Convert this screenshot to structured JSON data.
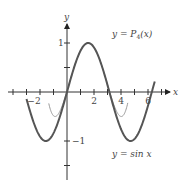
{
  "chart_data": {
    "type": "line",
    "title": "",
    "xlabel": "x",
    "ylabel": "y",
    "xlim": [
      -3.5,
      8.5
    ],
    "ylim": [
      -1.9,
      1.9
    ],
    "grid": false,
    "x_tick_labels": [
      "-2",
      "2",
      "4",
      "6"
    ],
    "x_tick_values": [
      -2,
      2,
      4,
      6
    ],
    "x_minor_step": 1,
    "y_tick_labels": [
      "1",
      "-1"
    ],
    "y_tick_values": [
      1,
      -1
    ],
    "y_minor_step": 0.5,
    "series": [
      {
        "name": "y = sin x",
        "label": "y = sin x",
        "expression": "sin(x)",
        "domain": [
          -3,
          6.5
        ],
        "color": "#555555",
        "stroke_width": 2
      },
      {
        "name": "y = P4(x)",
        "label_prefix": "y = P",
        "label_sub": "4",
        "label_suffix": "(x)",
        "expression": "1 - (x - pi/2)^2/2 + (x - pi/2)^4/24",
        "domain": [
          -1.35,
          4.5
        ],
        "color": "#999999",
        "stroke_width": 1
      }
    ],
    "annotations": [
      {
        "text": "y = P4(x)",
        "x": 3.3,
        "y": 1.1
      },
      {
        "text": "y = sin x",
        "x": 3.3,
        "y": -1.45
      }
    ]
  },
  "labels": {
    "x_axis": "x",
    "y_axis": "y",
    "xt_m2": "−2",
    "xt_2": "2",
    "xt_4": "4",
    "xt_6": "6",
    "yt_1": "1",
    "yt_m1": "−1",
    "p4_y": "y = P",
    "p4_sub": "4",
    "p4_x": "(x)",
    "sin_label_a": "y = sin ",
    "sin_label_b": "x"
  }
}
